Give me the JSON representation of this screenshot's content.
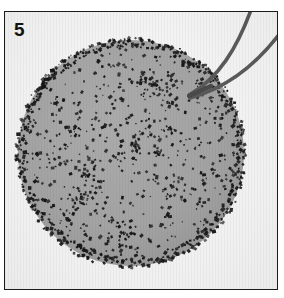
{
  "figure": {
    "panel_label": "5",
    "kind": "micrograph-panel"
  },
  "colors": {
    "plate_background": "#f3f3f3",
    "frame_border": "#1b1b1b",
    "specimen_fill": "#a3a3a3",
    "specimen_fill_dark": "#9a9a9a",
    "speckle": "#171717",
    "pipette_stroke": "#5a5a5a",
    "pipette_stroke_dark": "#4a4a4a",
    "label_color": "#121212",
    "page_background": "#ffffff"
  },
  "specimen": {
    "name": "circular-specimen",
    "center_x": 126,
    "center_y": 141,
    "radius": 113,
    "rim_band_width": 9,
    "speckle_count_interior": 620,
    "speckle_count_rim": 300,
    "speckle_min_size": 1.2,
    "speckle_max_size": 3.2
  },
  "pipette": {
    "name": "micropipette",
    "tip_x": 184,
    "tip_y": 82,
    "upper_line": {
      "start_x": 184,
      "start_y": 83,
      "c1_x": 214,
      "c1_y": 66,
      "c2_x": 232,
      "c2_y": 36,
      "end_x": 246,
      "end_y": -2,
      "width": 3.6
    },
    "lower_line": {
      "start_x": 185,
      "start_y": 86,
      "c1_x": 222,
      "c1_y": 76,
      "c2_x": 252,
      "c2_y": 52,
      "end_x": 276,
      "end_y": 20,
      "width": 3.6
    },
    "shank_line": {
      "start_x": 184,
      "start_y": 84,
      "end_x": 206,
      "end_y": 74,
      "width": 4.2
    }
  },
  "frame": {
    "name": "plate-frame",
    "left": 4,
    "top": 11,
    "width": 274,
    "height": 279,
    "border_width": 1.5
  }
}
